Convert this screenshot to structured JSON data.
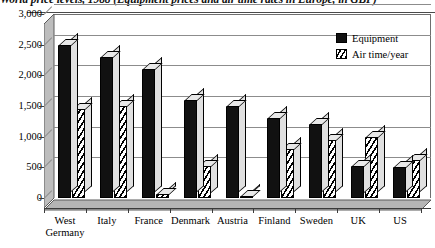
{
  "chart_data": {
    "type": "bar",
    "title": "World price levels, 1988 (Equipment prices and air time rates in Europe, in GBP)",
    "xlabel": "",
    "ylabel": "",
    "ylim": [
      0,
      3000
    ],
    "ytick_values": [
      0,
      500,
      1000,
      1500,
      2000,
      2500,
      3000
    ],
    "ytick_labels": [
      "0",
      "500",
      "1,000",
      "1,500",
      "2,000",
      "2,500",
      "3,000"
    ],
    "grid": true,
    "legend_position": "top-right",
    "categories": [
      "West\nGermany",
      "Italy",
      "France",
      "Denmark",
      "Austria",
      "Finland",
      "Sweden",
      "UK",
      "US"
    ],
    "series": [
      {
        "name": "Equipment",
        "pattern": "solid-black",
        "color": "#111111",
        "values": [
          2500,
          2300,
          2100,
          1600,
          1500,
          1300,
          1200,
          530,
          500
        ]
      },
      {
        "name": "Air time/year",
        "pattern": "diagonal-hatch",
        "color": "#111111",
        "values": [
          1450,
          1500,
          60,
          530,
          30,
          800,
          950,
          1000,
          620
        ]
      }
    ]
  },
  "legend": {
    "items": [
      {
        "label": "Equipment",
        "swatch": "solid-swatch-icon"
      },
      {
        "label": "Air time/year",
        "swatch": "hatched-swatch-icon"
      }
    ]
  }
}
